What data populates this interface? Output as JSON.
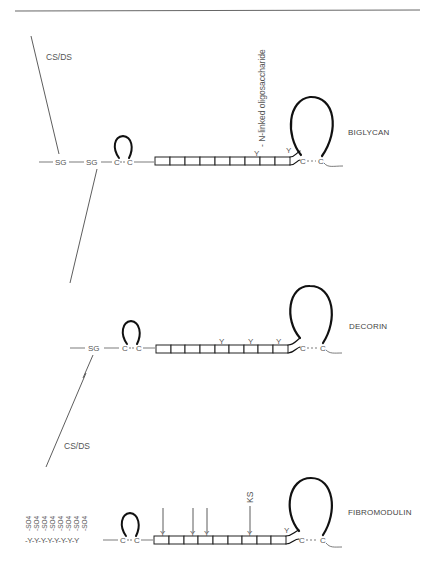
{
  "figure": {
    "top_rule": true,
    "molecules": [
      {
        "name": "BIGLYCAN",
        "n_terminal": [
          "SG",
          "SG"
        ],
        "gag_chains": [
          {
            "label": "CS/DS",
            "attached_to": "SG 1",
            "direction": "up"
          },
          {
            "label": "",
            "attached_to": "SG 2",
            "direction": "down"
          }
        ],
        "disulfide_n": [
          "C",
          "C"
        ],
        "repeat_boxes": 9,
        "oligosaccharide_sites": [
          8,
          10
        ],
        "annotation": "- N-linked oligosaccharide",
        "disulfide_c": [
          "C",
          "C"
        ]
      },
      {
        "name": "DECORIN",
        "n_terminal": [
          "SG"
        ],
        "gag_chains": [
          {
            "label": "CS/DS",
            "attached_to": "SG",
            "direction": "down"
          }
        ],
        "disulfide_n": [
          "C",
          "C"
        ],
        "repeat_boxes": 9,
        "oligosaccharide_sites": [
          5,
          7,
          9
        ],
        "disulfide_c": [
          "C",
          "C"
        ]
      },
      {
        "name": "FIBROMODULIN",
        "n_terminal": [
          "-Y",
          "Y",
          "Y",
          "Y",
          "Y",
          "Y",
          "Y",
          "Y"
        ],
        "sulfate_label": "-SO4",
        "sulfate_count": 8,
        "disulfide_n": [
          "C",
          "C"
        ],
        "repeat_boxes": 9,
        "ks_sites": [
          1,
          3,
          4,
          7
        ],
        "ks_label": "KS",
        "oligosaccharide_sites": [
          10
        ],
        "disulfide_c": [
          "C",
          "C"
        ]
      }
    ]
  },
  "labels": {
    "csds_top": "CS/DS",
    "csds_bottom": "CS/DS",
    "nlinked": "- N-linked oligosaccharide",
    "biglycan": "BIGLYCAN",
    "decorin": "DECORIN",
    "fibromodulin": "FIBROMODULIN",
    "ks": "KS",
    "sg1": "SG",
    "sg2": "SG",
    "sg3": "SG",
    "c": "C",
    "y": "Y",
    "ytail": "-Y-Y-Y-Y-Y-Y-Y-Y",
    "so4": "-SO4",
    "glyco": "Y"
  }
}
